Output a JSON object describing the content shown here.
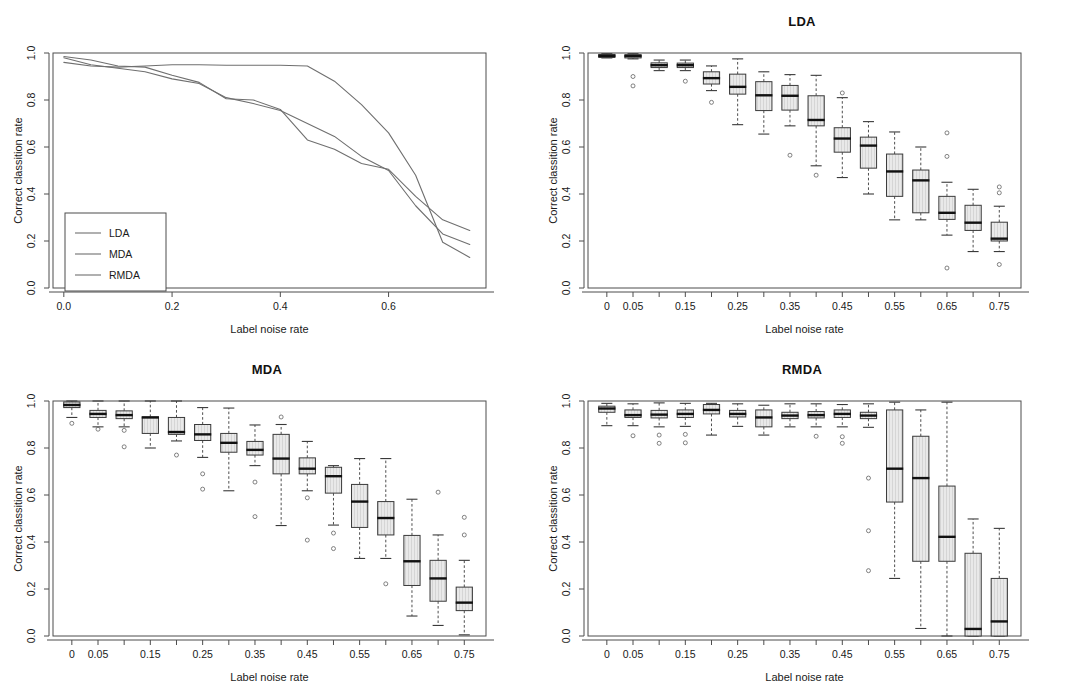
{
  "figure": {
    "width": 1069,
    "height": 696,
    "background": "#ffffff",
    "line_color": "#6f6f6f",
    "box_fill": "#e8e8e8",
    "box_stroke": "#3a3a3a",
    "median_color": "#111111",
    "frame_color": "#4d4d4d"
  },
  "panels": [
    {
      "key": "line",
      "title": "",
      "xlabel": "Label noise rate",
      "ylabel": "Correct classition rate"
    },
    {
      "key": "lda",
      "title": "LDA",
      "xlabel": "Label noise rate",
      "ylabel": "Correct classition rate"
    },
    {
      "key": "mda",
      "title": "MDA",
      "xlabel": "Label noise rate",
      "ylabel": "Correct classition rate"
    },
    {
      "key": "rmda",
      "title": "RMDA",
      "xlabel": "Label noise rate",
      "ylabel": "Correct classition rate"
    }
  ],
  "chart_data": [
    {
      "id": "mean-curves",
      "type": "line",
      "title": "",
      "xlabel": "Label noise rate",
      "ylabel": "Correct classition rate",
      "xlim": [
        -0.02,
        0.78
      ],
      "ylim": [
        0.0,
        1.0
      ],
      "xticks": [
        0.0,
        0.2,
        0.4,
        0.6
      ],
      "xticklabels": [
        "0.0",
        "0.2",
        "0.4",
        "0.6"
      ],
      "yticks": [
        0.0,
        0.2,
        0.4,
        0.6,
        0.8,
        1.0
      ],
      "yticklabels": [
        "0.0",
        "0.2",
        "0.4",
        "0.6",
        "0.8",
        "1.0"
      ],
      "grid": false,
      "legend": {
        "position": "bottom-left",
        "entries": [
          "LDA",
          "MDA",
          "RMDA"
        ]
      },
      "x": [
        0.0,
        0.05,
        0.1,
        0.15,
        0.2,
        0.25,
        0.3,
        0.35,
        0.4,
        0.45,
        0.5,
        0.55,
        0.6,
        0.65,
        0.7,
        0.75
      ],
      "series": [
        {
          "name": "LDA",
          "values": [
            0.985,
            0.97,
            0.945,
            0.94,
            0.905,
            0.875,
            0.805,
            0.8,
            0.76,
            0.63,
            0.59,
            0.53,
            0.505,
            0.39,
            0.29,
            0.245
          ]
        },
        {
          "name": "MDA",
          "values": [
            0.98,
            0.95,
            0.935,
            0.92,
            0.89,
            0.87,
            0.81,
            0.785,
            0.755,
            0.7,
            0.645,
            0.56,
            0.5,
            0.35,
            0.23,
            0.185
          ]
        },
        {
          "name": "RMDA",
          "values": [
            0.96,
            0.945,
            0.94,
            0.945,
            0.95,
            0.95,
            0.948,
            0.948,
            0.948,
            0.945,
            0.88,
            0.78,
            0.66,
            0.48,
            0.195,
            0.13
          ]
        }
      ]
    },
    {
      "id": "lda-boxplots",
      "type": "boxplot",
      "title": "LDA",
      "xlabel": "Label noise rate",
      "ylabel": "Correct classition rate",
      "ylim": [
        0.0,
        1.0
      ],
      "yticks": [
        0.0,
        0.2,
        0.4,
        0.6,
        0.8,
        1.0
      ],
      "yticklabels": [
        "0.0",
        "0.2",
        "0.4",
        "0.6",
        "0.8",
        "1.0"
      ],
      "categories": [
        "0",
        "0.05",
        "0.1",
        "0.15",
        "0.2",
        "0.25",
        "0.3",
        "0.35",
        "0.4",
        "0.45",
        "0.5",
        "0.55",
        "0.6",
        "0.65",
        "0.7",
        "0.75"
      ],
      "xticklabels_shown": [
        "0",
        "0.05",
        "",
        "0.15",
        "",
        "0.25",
        "",
        "0.35",
        "",
        "0.45",
        "",
        "0.55",
        "",
        "0.65",
        "",
        "0.75"
      ],
      "boxes": [
        {
          "lower": 0.979,
          "q1": 0.981,
          "median": 0.988,
          "q3": 0.994,
          "upper": 0.997,
          "outliers": []
        },
        {
          "lower": 0.975,
          "q1": 0.979,
          "median": 0.987,
          "q3": 0.993,
          "upper": 0.997,
          "outliers": [
            0.9,
            0.86
          ]
        },
        {
          "lower": 0.925,
          "q1": 0.938,
          "median": 0.948,
          "q3": 0.958,
          "upper": 0.97,
          "outliers": []
        },
        {
          "lower": 0.925,
          "q1": 0.938,
          "median": 0.948,
          "q3": 0.957,
          "upper": 0.97,
          "outliers": [
            0.88
          ]
        },
        {
          "lower": 0.84,
          "q1": 0.868,
          "median": 0.893,
          "q3": 0.92,
          "upper": 0.945,
          "outliers": [
            0.79
          ]
        },
        {
          "lower": 0.695,
          "q1": 0.825,
          "median": 0.856,
          "q3": 0.91,
          "upper": 0.975,
          "outliers": []
        },
        {
          "lower": 0.655,
          "q1": 0.755,
          "median": 0.82,
          "q3": 0.878,
          "upper": 0.92,
          "outliers": []
        },
        {
          "lower": 0.69,
          "q1": 0.757,
          "median": 0.818,
          "q3": 0.862,
          "upper": 0.908,
          "outliers": [
            0.565
          ]
        },
        {
          "lower": 0.52,
          "q1": 0.69,
          "median": 0.715,
          "q3": 0.818,
          "upper": 0.905,
          "outliers": [
            0.48
          ]
        },
        {
          "lower": 0.47,
          "q1": 0.578,
          "median": 0.636,
          "q3": 0.682,
          "upper": 0.81,
          "outliers": [
            0.83
          ]
        },
        {
          "lower": 0.4,
          "q1": 0.51,
          "median": 0.606,
          "q3": 0.642,
          "upper": 0.708,
          "outliers": []
        },
        {
          "lower": 0.29,
          "q1": 0.39,
          "median": 0.496,
          "q3": 0.57,
          "upper": 0.664,
          "outliers": []
        },
        {
          "lower": 0.29,
          "q1": 0.32,
          "median": 0.458,
          "q3": 0.502,
          "upper": 0.6,
          "outliers": []
        },
        {
          "lower": 0.225,
          "q1": 0.292,
          "median": 0.32,
          "q3": 0.39,
          "upper": 0.45,
          "outliers": [
            0.66,
            0.56,
            0.085
          ]
        },
        {
          "lower": 0.155,
          "q1": 0.245,
          "median": 0.278,
          "q3": 0.352,
          "upper": 0.42,
          "outliers": []
        },
        {
          "lower": 0.155,
          "q1": 0.2,
          "median": 0.21,
          "q3": 0.28,
          "upper": 0.348,
          "outliers": [
            0.43,
            0.405,
            0.1
          ]
        }
      ]
    },
    {
      "id": "mda-boxplots",
      "type": "boxplot",
      "title": "MDA",
      "xlabel": "Label noise rate",
      "ylabel": "Correct classition rate",
      "ylim": [
        0.0,
        1.0
      ],
      "yticks": [
        0.0,
        0.2,
        0.4,
        0.6,
        0.8,
        1.0
      ],
      "yticklabels": [
        "0.0",
        "0.2",
        "0.4",
        "0.6",
        "0.8",
        "1.0"
      ],
      "categories": [
        "0",
        "0.05",
        "0.1",
        "0.15",
        "0.2",
        "0.25",
        "0.3",
        "0.35",
        "0.4",
        "0.45",
        "0.5",
        "0.55",
        "0.6",
        "0.65",
        "0.7",
        "0.75"
      ],
      "xticklabels_shown": [
        "0",
        "0.05",
        "",
        "0.15",
        "",
        "0.25",
        "",
        "0.35",
        "",
        "0.45",
        "",
        "0.55",
        "",
        "0.65",
        "",
        "0.75"
      ],
      "boxes": [
        {
          "lower": 0.93,
          "q1": 0.972,
          "median": 0.983,
          "q3": 0.996,
          "upper": 1.0,
          "outliers": [
            0.905
          ]
        },
        {
          "lower": 0.89,
          "q1": 0.93,
          "median": 0.945,
          "q3": 0.96,
          "upper": 1.0,
          "outliers": [
            0.88
          ]
        },
        {
          "lower": 0.89,
          "q1": 0.925,
          "median": 0.94,
          "q3": 0.958,
          "upper": 1.0,
          "outliers": [
            0.875,
            0.805
          ]
        },
        {
          "lower": 0.8,
          "q1": 0.862,
          "median": 0.93,
          "q3": 0.932,
          "upper": 1.0,
          "outliers": []
        },
        {
          "lower": 0.83,
          "q1": 0.858,
          "median": 0.868,
          "q3": 0.93,
          "upper": 1.0,
          "outliers": [
            0.77
          ]
        },
        {
          "lower": 0.76,
          "q1": 0.832,
          "median": 0.858,
          "q3": 0.9,
          "upper": 0.972,
          "outliers": [
            0.69,
            0.625
          ]
        },
        {
          "lower": 0.618,
          "q1": 0.782,
          "median": 0.822,
          "q3": 0.862,
          "upper": 0.97,
          "outliers": []
        },
        {
          "lower": 0.725,
          "q1": 0.77,
          "median": 0.792,
          "q3": 0.828,
          "upper": 0.898,
          "outliers": [
            0.655,
            0.508
          ]
        },
        {
          "lower": 0.47,
          "q1": 0.69,
          "median": 0.755,
          "q3": 0.858,
          "upper": 0.9,
          "outliers": [
            0.932
          ]
        },
        {
          "lower": 0.618,
          "q1": 0.69,
          "median": 0.712,
          "q3": 0.758,
          "upper": 0.828,
          "outliers": [
            0.588,
            0.408
          ]
        },
        {
          "lower": 0.472,
          "q1": 0.608,
          "median": 0.68,
          "q3": 0.718,
          "upper": 0.725,
          "outliers": [
            0.438,
            0.372
          ]
        },
        {
          "lower": 0.33,
          "q1": 0.462,
          "median": 0.572,
          "q3": 0.645,
          "upper": 0.755,
          "outliers": []
        },
        {
          "lower": 0.33,
          "q1": 0.43,
          "median": 0.502,
          "q3": 0.572,
          "upper": 0.755,
          "outliers": [
            0.222
          ]
        },
        {
          "lower": 0.085,
          "q1": 0.215,
          "median": 0.318,
          "q3": 0.428,
          "upper": 0.582,
          "outliers": []
        },
        {
          "lower": 0.045,
          "q1": 0.148,
          "median": 0.245,
          "q3": 0.322,
          "upper": 0.43,
          "outliers": [
            0.612
          ]
        },
        {
          "lower": 0.005,
          "q1": 0.108,
          "median": 0.142,
          "q3": 0.208,
          "upper": 0.322,
          "outliers": [
            0.505,
            0.43
          ]
        }
      ]
    },
    {
      "id": "rmda-boxplots",
      "type": "boxplot",
      "title": "RMDA",
      "xlabel": "Label noise rate",
      "ylabel": "Correct classition rate",
      "ylim": [
        0.0,
        1.0
      ],
      "yticks": [
        0.0,
        0.2,
        0.4,
        0.6,
        0.8,
        1.0
      ],
      "yticklabels": [
        "0.0",
        "0.2",
        "0.4",
        "0.6",
        "0.8",
        "1.0"
      ],
      "categories": [
        "0",
        "0.05",
        "0.1",
        "0.15",
        "0.2",
        "0.25",
        "0.3",
        "0.35",
        "0.4",
        "0.45",
        "0.5",
        "0.55",
        "0.6",
        "0.65",
        "0.7",
        "0.75"
      ],
      "xticklabels_shown": [
        "0",
        "0.05",
        "",
        "0.15",
        "",
        "0.25",
        "",
        "0.35",
        "",
        "0.45",
        "",
        "0.55",
        "",
        "0.65",
        "",
        "0.75"
      ],
      "boxes": [
        {
          "lower": 0.895,
          "q1": 0.952,
          "median": 0.968,
          "q3": 0.978,
          "upper": 0.99,
          "outliers": []
        },
        {
          "lower": 0.895,
          "q1": 0.93,
          "median": 0.94,
          "q3": 0.962,
          "upper": 0.988,
          "outliers": [
            0.852
          ]
        },
        {
          "lower": 0.89,
          "q1": 0.928,
          "median": 0.942,
          "q3": 0.96,
          "upper": 0.992,
          "outliers": [
            0.855,
            0.82
          ]
        },
        {
          "lower": 0.892,
          "q1": 0.93,
          "median": 0.945,
          "q3": 0.962,
          "upper": 0.99,
          "outliers": [
            0.858,
            0.822
          ]
        },
        {
          "lower": 0.855,
          "q1": 0.945,
          "median": 0.962,
          "q3": 0.985,
          "upper": 0.99,
          "outliers": []
        },
        {
          "lower": 0.892,
          "q1": 0.932,
          "median": 0.945,
          "q3": 0.96,
          "upper": 0.988,
          "outliers": []
        },
        {
          "lower": 0.855,
          "q1": 0.89,
          "median": 0.93,
          "q3": 0.962,
          "upper": 0.982,
          "outliers": []
        },
        {
          "lower": 0.89,
          "q1": 0.925,
          "median": 0.938,
          "q3": 0.952,
          "upper": 0.988,
          "outliers": []
        },
        {
          "lower": 0.89,
          "q1": 0.928,
          "median": 0.94,
          "q3": 0.955,
          "upper": 0.988,
          "outliers": [
            0.85
          ]
        },
        {
          "lower": 0.89,
          "q1": 0.93,
          "median": 0.945,
          "q3": 0.962,
          "upper": 0.985,
          "outliers": [
            0.848,
            0.82
          ]
        },
        {
          "lower": 0.888,
          "q1": 0.925,
          "median": 0.938,
          "q3": 0.952,
          "upper": 0.988,
          "outliers": [
            0.672,
            0.448,
            0.278
          ]
        },
        {
          "lower": 0.245,
          "q1": 0.57,
          "median": 0.712,
          "q3": 0.962,
          "upper": 0.995,
          "outliers": []
        },
        {
          "lower": 0.032,
          "q1": 0.318,
          "median": 0.672,
          "q3": 0.85,
          "upper": 0.962,
          "outliers": []
        },
        {
          "lower": 0.0,
          "q1": 0.318,
          "median": 0.422,
          "q3": 0.638,
          "upper": 0.995,
          "outliers": []
        },
        {
          "lower": 0.0,
          "q1": 0.0,
          "median": 0.03,
          "q3": 0.352,
          "upper": 0.498,
          "outliers": []
        },
        {
          "lower": 0.0,
          "q1": 0.0,
          "median": 0.062,
          "q3": 0.245,
          "upper": 0.458,
          "outliers": []
        }
      ]
    }
  ]
}
